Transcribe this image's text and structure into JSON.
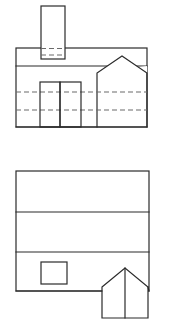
{
  "document": {
    "title": "Building Elevation and Plan Line Drawing",
    "description": "Two-part black-and-white architectural line drawing of a house: an upper front elevation with a tower/chimney, double doors and a gabled right wing, and a lower roof plan with a square opening and a gabled porch projection.",
    "canvas": {
      "width": 170,
      "height": 332,
      "background_color": "#ffffff"
    },
    "line_styles": {
      "solid_color": "#2b2b2b",
      "solid_width": 1.2,
      "hidden_color": "#6a6a6a",
      "hidden_width": 1.1,
      "hidden_dash_pattern": "5 3"
    }
  },
  "views": [
    {
      "id": "upper-elevation",
      "name": "Front Elevation",
      "bounds": {
        "x": 16,
        "y": 48,
        "width": 131,
        "height": 79
      },
      "parts": [
        {
          "id": "main-body",
          "name": "Main Building Body",
          "type": "rectangle",
          "x": 16,
          "y": 48,
          "width": 131,
          "height": 79
        },
        {
          "id": "tower",
          "name": "Tower / Chimney Shaft",
          "type": "rectangle",
          "x": 41,
          "y": 6,
          "width": 24,
          "height": 53
        },
        {
          "id": "eave-line",
          "name": "Eave Line",
          "type": "horizontal-line",
          "y": 66,
          "x1": 16,
          "x2": 147
        },
        {
          "id": "door-left",
          "name": "Left Door Panel",
          "type": "rectangle",
          "x": 40,
          "y": 82,
          "width": 20,
          "height": 45
        },
        {
          "id": "door-right",
          "name": "Right Door Panel",
          "type": "rectangle",
          "x": 60,
          "y": 82,
          "width": 21,
          "height": 45
        },
        {
          "id": "gable-wing",
          "name": "Right Gabled Wing",
          "type": "polyline",
          "points": "97,127 97,73 122,56 147,73 147,127"
        },
        {
          "id": "hidden-floor-line-upper",
          "name": "Upper Hidden Floor Line",
          "type": "hidden-horizontal",
          "y": 92,
          "x1": 16,
          "x2": 147
        },
        {
          "id": "hidden-floor-line-lower",
          "name": "Lower Hidden Floor Line",
          "type": "hidden-horizontal",
          "y": 110,
          "x1": 16,
          "x2": 147
        },
        {
          "id": "hidden-tower-line",
          "name": "Hidden Tower Base Line",
          "type": "hidden-horizontal",
          "y": 55,
          "x1": 41,
          "x2": 65
        }
      ]
    },
    {
      "id": "lower-plan",
      "name": "Roof Plan",
      "bounds": {
        "x": 16,
        "y": 171,
        "width": 133,
        "height": 120
      },
      "parts": [
        {
          "id": "plan-outline",
          "name": "Roof Plan Outline",
          "type": "rectangle",
          "x": 16,
          "y": 171,
          "width": 133,
          "height": 120
        },
        {
          "id": "ridge-line-upper",
          "name": "Upper Ridge Line",
          "type": "horizontal-line",
          "y": 212,
          "x1": 16,
          "x2": 149
        },
        {
          "id": "ridge-line-lower",
          "name": "Lower Ridge Line",
          "type": "horizontal-line",
          "y": 252,
          "x1": 16,
          "x2": 149
        },
        {
          "id": "square-opening",
          "name": "Square Roof Opening",
          "type": "rectangle",
          "x": 41,
          "y": 262,
          "width": 26,
          "height": 22
        },
        {
          "id": "porch-gable",
          "name": "Gabled Porch Projection",
          "type": "polyline",
          "points": "102,318 102,287 125,268 148,287 148,318"
        },
        {
          "id": "porch-ridge",
          "name": "Porch Center Ridge",
          "type": "vertical-line",
          "x": 125,
          "y1": 268,
          "y2": 318
        },
        {
          "id": "porch-base",
          "name": "Porch Base Line",
          "type": "horizontal-line",
          "y": 318,
          "x1": 102,
          "x2": 148
        }
      ]
    }
  ]
}
